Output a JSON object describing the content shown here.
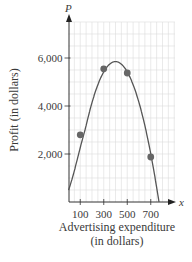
{
  "chart_data": {
    "type": "line",
    "title": "",
    "xlabel": "Advertising expenditure (in dollars)",
    "xlabel_lines": [
      "Advertising expenditure",
      "(in dollars)"
    ],
    "ylabel": "Profit (in dollars)",
    "x_axis_var": "x",
    "y_axis_var": "P",
    "x_ticks": [
      100,
      300,
      500,
      700
    ],
    "x_tick_labels": [
      "100",
      "300",
      "500",
      "700"
    ],
    "y_ticks": [
      2000,
      4000,
      6000
    ],
    "y_tick_labels": [
      "2,000",
      "4,000",
      "6,000"
    ],
    "xlim": [
      0,
      850
    ],
    "ylim": [
      0,
      7500
    ],
    "grid": true,
    "grid_minor_x": 50,
    "grid_minor_y": 500,
    "legend": null,
    "series": [
      {
        "name": "data points",
        "type": "scatter",
        "x": [
          100,
          300,
          500,
          700
        ],
        "y": [
          2800,
          5550,
          5375,
          1875
        ]
      },
      {
        "name": "quadratic model",
        "type": "line",
        "x": [
          0,
          100,
          200,
          300,
          400,
          500,
          600,
          700,
          770
        ],
        "y": [
          500,
          2800,
          4620,
          5570,
          5850,
          5350,
          4150,
          1950,
          0
        ]
      }
    ],
    "colors": {
      "curve": "#555555",
      "points": "#666666",
      "grid": "#dcdcdc",
      "axis": "#333333"
    }
  }
}
